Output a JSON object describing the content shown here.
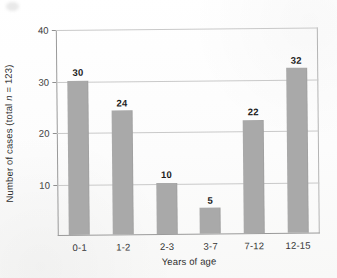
{
  "chart_data": {
    "type": "bar",
    "title": "",
    "subtitle": "",
    "categories": [
      "0-1",
      "1-2",
      "2-3",
      "3-7",
      "7-12",
      "12-15"
    ],
    "values": [
      30,
      24,
      10,
      5,
      22,
      32
    ],
    "value_labels": [
      "30",
      "24",
      "10",
      "5",
      "22",
      "32"
    ],
    "xlabel": "Years of age",
    "ylabel": "Number of cases (total n = 123)",
    "ylabel_prefix": "Number of cases (total ",
    "ylabel_italic": "n",
    "ylabel_suffix": " = 123)",
    "ylim": [
      0,
      40
    ],
    "xlim_note": "categorical",
    "yticks": [
      10,
      20,
      30,
      40
    ],
    "ytick_labels": [
      "10",
      "20",
      "30",
      "40"
    ],
    "grid": "horizontal",
    "legend": "none",
    "total_n": 123,
    "bar_color": "#a9a9a9",
    "gridline_color": "#c9c9c9",
    "axis_color": "#9a9a9a",
    "text_color": "#2e2e2e",
    "background_color": "#fdfdfd",
    "annotations": [
      "Value labels printed in bold above each bar"
    ]
  },
  "figure": {
    "axis_titles": {
      "x": "Years of age",
      "y": "Number of cases (total n = 123)"
    }
  }
}
